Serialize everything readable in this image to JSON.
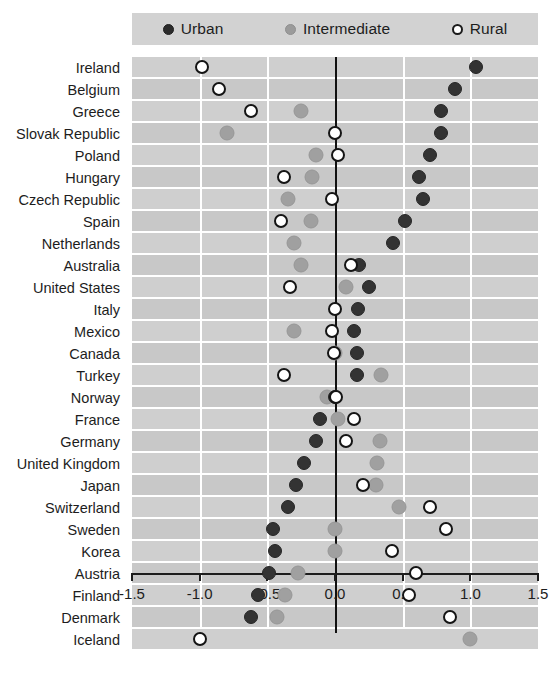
{
  "legend": {
    "items": [
      {
        "label": "Urban",
        "marker": "filled-dark-circle-icon",
        "color": "#2b2b2b"
      },
      {
        "label": "Intermediate",
        "marker": "filled-gray-circle-icon",
        "color": "#9b9b9b"
      },
      {
        "label": "Rural",
        "marker": "open-circle-icon",
        "color": "#ffffff"
      }
    ]
  },
  "chart_data": {
    "type": "scatter",
    "title": "",
    "subtitle": "",
    "xlabel": "",
    "ylabel": "",
    "xlim": [
      -1.5,
      1.5
    ],
    "xticks": [
      -1.5,
      -1.0,
      -0.5,
      0.0,
      0.5,
      1.0,
      1.5
    ],
    "xtick_labels": [
      "-1.5",
      "-1.0",
      "-0.5",
      "0.0",
      "0.5",
      "1.0",
      "1.5"
    ],
    "grid": true,
    "legend_position": "top",
    "zero_reference_line": 0.0,
    "categories": [
      "Ireland",
      "Belgium",
      "Greece",
      "Slovak Republic",
      "Poland",
      "Hungary",
      "Czech Republic",
      "Spain",
      "Netherlands",
      "Australia",
      "United States",
      "Italy",
      "Mexico",
      "Canada",
      "Turkey",
      "Norway",
      "France",
      "Germany",
      "United Kingdom",
      "Japan",
      "Switzerland",
      "Sweden",
      "Korea",
      "Austria",
      "Finland",
      "Denmark",
      "Iceland"
    ],
    "series": [
      {
        "name": "Urban",
        "marker": "filled-dark-circle-icon",
        "color": "#333333",
        "values": [
          1.04,
          0.89,
          0.78,
          0.78,
          0.7,
          0.62,
          0.65,
          0.52,
          0.43,
          0.18,
          0.25,
          0.17,
          0.14,
          0.16,
          0.16,
          0.0,
          -0.11,
          -0.14,
          -0.23,
          -0.29,
          -0.35,
          -0.46,
          -0.44,
          -0.49,
          -0.57,
          -0.62,
          null
        ]
      },
      {
        "name": "Intermediate",
        "marker": "filled-gray-circle-icon",
        "color": "#a0a0a0",
        "values": [
          null,
          null,
          -0.25,
          -0.8,
          -0.14,
          -0.17,
          -0.35,
          -0.18,
          -0.3,
          -0.25,
          0.08,
          null,
          -0.3,
          0.0,
          0.34,
          -0.06,
          0.02,
          0.33,
          0.31,
          0.3,
          0.47,
          0.0,
          0.0,
          -0.27,
          -0.37,
          -0.43,
          1.0
        ]
      },
      {
        "name": "Rural",
        "marker": "open-circle-icon",
        "color": "#ffffff",
        "values": [
          -0.98,
          -0.86,
          -0.62,
          0.0,
          0.02,
          -0.38,
          -0.02,
          -0.4,
          null,
          0.12,
          -0.33,
          0.0,
          -0.02,
          -0.01,
          -0.38,
          0.01,
          0.14,
          0.08,
          null,
          0.21,
          0.7,
          0.82,
          0.42,
          0.6,
          0.55,
          0.85,
          -1.0
        ]
      }
    ]
  }
}
